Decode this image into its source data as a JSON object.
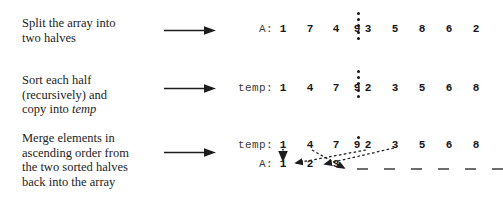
{
  "diagram": {
    "steps": [
      {
        "id": "split",
        "lines": [
          "Split the array into",
          "two halves"
        ],
        "arrow_icon": "right-arrow-icon"
      },
      {
        "id": "sort-copy",
        "lines": [
          "Sort each half",
          "(recursively) and",
          "copy into "
        ],
        "emphasis": "temp",
        "arrow_icon": "right-arrow-icon"
      },
      {
        "id": "merge",
        "lines": [
          "Merge elements in",
          "ascending order from",
          "the two sorted halves",
          "back into the array"
        ],
        "arrow_icon": "right-arrow-icon"
      }
    ],
    "rows": [
      {
        "id": "row-a-unsorted",
        "label": "A:",
        "values": [
          "1",
          "7",
          "4",
          "9",
          "3",
          "5",
          "8",
          "6",
          "2"
        ],
        "split_after": 4,
        "divider": "vertical-dotted-divider"
      },
      {
        "id": "row-temp-sorted",
        "label": "temp:",
        "values": [
          "1",
          "4",
          "7",
          "9",
          "2",
          "3",
          "5",
          "6",
          "8"
        ],
        "split_after": 4,
        "divider": "vertical-dotted-divider"
      },
      {
        "id": "row-temp-merge-source",
        "label": "temp:",
        "values": [
          "1",
          "4",
          "7",
          "9",
          "2",
          "3",
          "5",
          "6",
          "8"
        ],
        "split_after": 4,
        "divider": "single-dot-divider"
      },
      {
        "id": "row-a-merge-target",
        "label": "A:",
        "values": [
          "1",
          "2",
          "3",
          "_",
          "_",
          "_",
          "_",
          "_",
          "_"
        ],
        "filled_count": 3,
        "blank_count": 6
      }
    ],
    "merge_arrows": [
      {
        "from_value": "1",
        "from_index": 0,
        "to_index": 0,
        "style": "dotted-vertical"
      },
      {
        "from_value": "4",
        "from_index": 1,
        "to_index": 3,
        "style": "dashed-diagonal"
      },
      {
        "from_value": "2",
        "from_index": 4,
        "to_index": 1,
        "style": "dashed-diagonal"
      },
      {
        "from_value": "3",
        "from_index": 5,
        "to_index": 2,
        "style": "dashed-diagonal"
      }
    ],
    "colors": {
      "ink": "#171717",
      "text": "#232323",
      "background": "#ffffff",
      "rule": "#6d6d6d"
    }
  }
}
